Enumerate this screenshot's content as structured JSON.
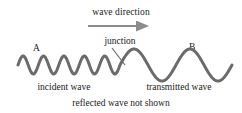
{
  "figure": {
    "title_label": "wave direction",
    "junction_label": "junction",
    "label_a": "A",
    "label_b": "B",
    "incident_label": "incident wave",
    "transmitted_label": "transmitted wave",
    "note_label": "reflected wave not shown",
    "colors": {
      "wave": "#6b6b6b",
      "arrow": "#8c8c8c",
      "leader": "#6b6b6b",
      "text": "#1a1a1a",
      "background": "#ffffff"
    },
    "wave_geometry": {
      "baseline_y": 65,
      "incident": {
        "x_start": 18,
        "x_end": 120,
        "amplitude": 9,
        "cycles": 5
      },
      "transmitted": {
        "x_start": 120,
        "x_end": 232,
        "amplitude": 16,
        "cycles": 2
      },
      "junction_x": 120,
      "stroke_width": 3
    },
    "arrow": {
      "x_start": 88,
      "x_end": 153,
      "y": 26,
      "direction": "right"
    },
    "leader_line": {
      "x_start": 112,
      "y_start": 48,
      "x_end": 124,
      "y_end": 64
    }
  }
}
